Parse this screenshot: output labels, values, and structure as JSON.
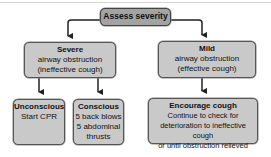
{
  "diagram": {
    "root": {
      "title": "Assess severity"
    },
    "severe": {
      "title": "Severe",
      "lines": [
        "airway obstruction",
        "(ineffective cough)"
      ]
    },
    "mild": {
      "title": "Mild",
      "lines": [
        "airway obstruction",
        "(effective cough)"
      ]
    },
    "unconscious": {
      "title": "Unconscious",
      "lines": [
        "Start CPR"
      ]
    },
    "conscious": {
      "title": "Conscious",
      "lines": [
        "5 back blows",
        "5 abdominal",
        "thrusts"
      ]
    },
    "encourage": {
      "title": "Encourage cough",
      "lines": [
        "Continue to check for",
        "deterioration to ineffective cough",
        "or until obstruction relieved"
      ]
    },
    "colors": {
      "root_fill": "#a3a3a3",
      "box_fill": "#c9c9c9",
      "border": "#555555",
      "arrow": "#222222"
    }
  }
}
